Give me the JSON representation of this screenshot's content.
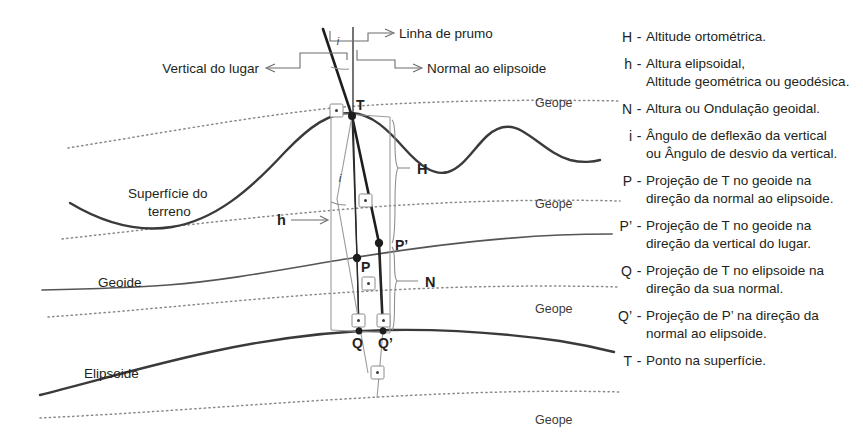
{
  "diagram": {
    "callouts": [
      {
        "id": "linha-de-prumo",
        "text": "Linha de prumo"
      },
      {
        "id": "normal-ao-elipsoide",
        "text": "Normal ao elipsoide"
      },
      {
        "id": "vertical-do-lugar",
        "text": "Vertical do lugar"
      }
    ],
    "surface_labels": [
      {
        "id": "superficie-do-terreno-line1",
        "text": "Superfície do"
      },
      {
        "id": "superficie-do-terreno-line2",
        "text": "terreno"
      },
      {
        "id": "geoide",
        "text": "Geoide"
      },
      {
        "id": "elipsoide",
        "text": "Elipsoide"
      }
    ],
    "geope_labels": [
      {
        "id": "geope-1",
        "text": "Geope"
      },
      {
        "id": "geope-2",
        "text": "Geope"
      },
      {
        "id": "geope-3",
        "text": "Geope"
      },
      {
        "id": "geope-4",
        "text": "Geope"
      }
    ],
    "point_labels": [
      {
        "id": "point-T",
        "text": "T"
      },
      {
        "id": "point-P",
        "text": "P"
      },
      {
        "id": "point-P-prime",
        "text": "P’"
      },
      {
        "id": "point-Q",
        "text": "Q"
      },
      {
        "id": "point-Q-prime",
        "text": "Q’"
      }
    ],
    "quantity_labels": [
      {
        "id": "quantity-H",
        "text": "H"
      },
      {
        "id": "quantity-h",
        "text": "h"
      },
      {
        "id": "quantity-N",
        "text": "N"
      }
    ],
    "angle_labels": [
      {
        "id": "angle-i-top",
        "text": "i"
      },
      {
        "id": "angle-i-middle",
        "text": "i"
      }
    ],
    "colors": {
      "background": "#ffffff",
      "text": "#231f20",
      "terrain_curve": "#3a3a3a",
      "geoid_curve": "#555555",
      "ellipsoid_curve": "#3a3a3a",
      "geope_dotted": "#8a8a8a",
      "plumb_line": "#1d1d1d",
      "construction_line": "#9a9a9a"
    }
  },
  "legend": {
    "items": [
      {
        "symbol": "H",
        "dash": "-",
        "line1": "Altitude ortométrica.",
        "line2": ""
      },
      {
        "symbol": "h",
        "dash": "-",
        "line1": "Altura elipsoidal,",
        "line2": "Altitude geométrica ou geodésica."
      },
      {
        "symbol": "N",
        "dash": "-",
        "line1": "Altura ou Ondulação geoidal.",
        "line2": ""
      },
      {
        "symbol": "i",
        "dash": "-",
        "line1": "Ângulo de deflexão da vertical",
        "line2": "ou Ângulo de desvio da vertical."
      },
      {
        "symbol": "P",
        "dash": "-",
        "line1": "Projeção de T no geoide na",
        "line2": "direção da normal ao elipsoide."
      },
      {
        "symbol": "P’",
        "dash": "-",
        "line1": "Projeção de T no geoide na",
        "line2": "direção da vertical do lugar."
      },
      {
        "symbol": "Q",
        "dash": "-",
        "line1": "Projeção de T no elipsoide na",
        "line2": "direção da sua normal."
      },
      {
        "symbol": "Q’",
        "dash": "-",
        "line1": "Projeção de P’ na direção da",
        "line2": "normal ao elipsoide."
      },
      {
        "symbol": "T",
        "dash": "-",
        "line1": "Ponto na superfície.",
        "line2": ""
      }
    ]
  }
}
